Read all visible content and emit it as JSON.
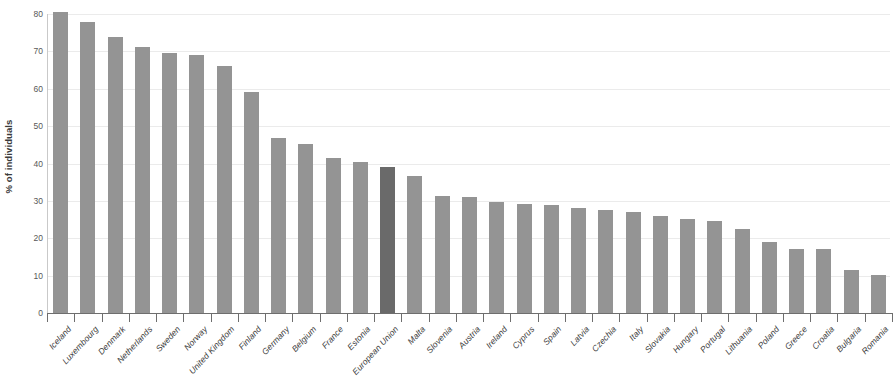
{
  "chart_data": {
    "type": "bar",
    "title": "",
    "subtitle": "",
    "xlabel": "",
    "ylabel": "% of individuals",
    "ylim": [
      0,
      80
    ],
    "yticks": [
      0,
      10,
      20,
      30,
      40,
      50,
      60,
      70,
      80
    ],
    "ytick_labels": [
      "0",
      "10",
      "20",
      "30",
      "40",
      "50",
      "60",
      "70",
      "80"
    ],
    "grid": true,
    "legend": "none",
    "highlight_category": "European Union",
    "colors": {
      "bar": "#949494",
      "bar_highlight": "#6a6a6a",
      "grid": "#ebebeb",
      "axis": "#6e6e6e",
      "text": "#3b3b3b"
    },
    "categories": [
      "Iceland",
      "Luxembourg",
      "Denmark",
      "Netherlands",
      "Sweden",
      "Norway",
      "United Kingdom",
      "Finland",
      "Germany",
      "Belgium",
      "France",
      "Estonia",
      "European Union",
      "Malta",
      "Slovenia",
      "Austria",
      "Ireland",
      "Cyprus",
      "Spain",
      "Latvia",
      "Czechia",
      "Italy",
      "Slovakia",
      "Hungary",
      "Portugal",
      "Lithuania",
      "Poland",
      "Greece",
      "Croatia",
      "Bulgaria",
      "Romania"
    ],
    "values": [
      80.5,
      77.8,
      73.9,
      71.2,
      69.6,
      69.1,
      66.0,
      59.2,
      46.8,
      45.3,
      41.4,
      40.5,
      39.2,
      36.7,
      31.2,
      31.1,
      29.6,
      29.3,
      28.9,
      28.2,
      27.5,
      27.0,
      25.9,
      25.1,
      24.6,
      22.5,
      19.0,
      17.2,
      17.0,
      11.5,
      10.2
    ]
  }
}
